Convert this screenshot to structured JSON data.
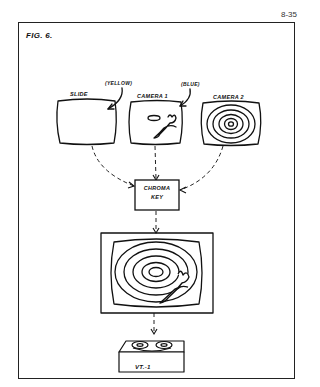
{
  "page": {
    "page_number": "8-35",
    "figure_label": "FIG. 6."
  },
  "sources": [
    {
      "label": "SLIDE",
      "annotation": "(YELLOW)",
      "content": "blank"
    },
    {
      "label": "CAMERA 1",
      "annotation": "(BLUE)",
      "content": "oval and figure"
    },
    {
      "label": "CAMERA 2",
      "annotation": "",
      "content": "concentric rings"
    }
  ],
  "processor": {
    "line1": "CHROMA",
    "line2": "KEY"
  },
  "output_monitor": {
    "content": "concentric rings with keyed figure"
  },
  "recorder": {
    "label": "VT.-1"
  }
}
